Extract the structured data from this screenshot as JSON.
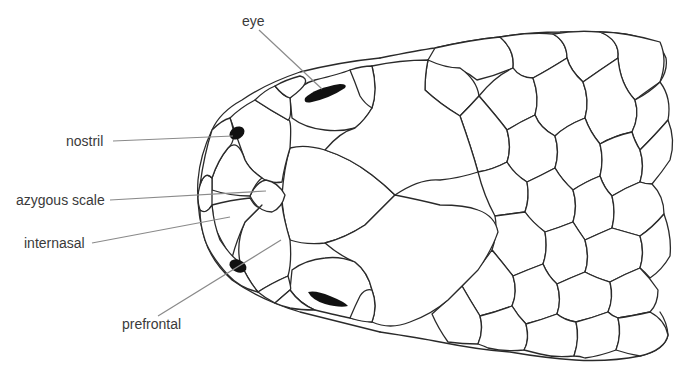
{
  "diagram": {
    "labels": [
      {
        "id": "eye",
        "text": "eye"
      },
      {
        "id": "nostril",
        "text": "nostril"
      },
      {
        "id": "azygous",
        "text": "azygous scale"
      },
      {
        "id": "internasal",
        "text": "internasal"
      },
      {
        "id": "prefrontal",
        "text": "prefrontal"
      }
    ],
    "colors": {
      "outline": "#2a2a2a",
      "leader_line": "#8a8a8a",
      "orifice_fill": "#111111",
      "label_text": "#3a3a3a",
      "background": "#ffffff"
    }
  }
}
